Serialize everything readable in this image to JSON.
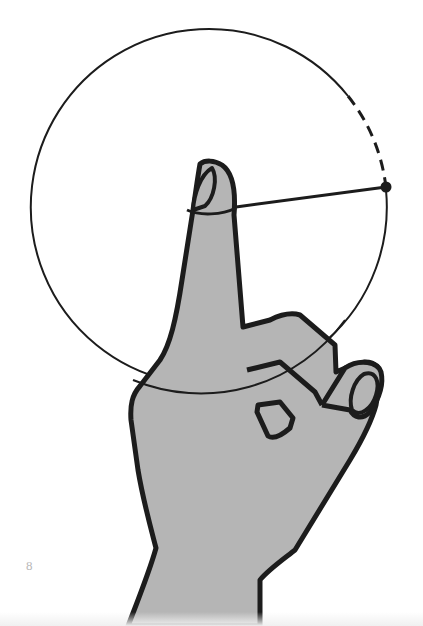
{
  "page": {
    "page_number": "8"
  },
  "illustration": {
    "subject": "hand with raised index finger tracing a circle with a string",
    "colors": {
      "skin_fill": "#b5b5b5",
      "outline": "#1c1c1c",
      "background": "#ffffff"
    },
    "circle": {
      "cx": 208,
      "cy": 206,
      "r": 178,
      "dashed_arc": "upper-right segment near the end point"
    },
    "string_end_point": {
      "x": 386,
      "y": 187
    }
  }
}
